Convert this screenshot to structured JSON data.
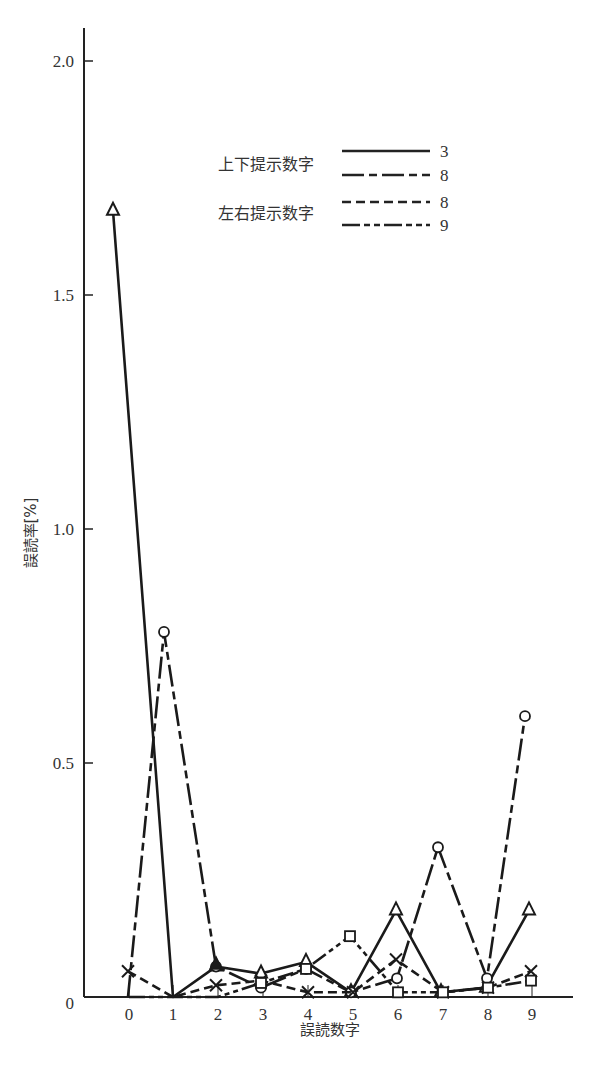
{
  "chart_data": {
    "type": "line",
    "title": "",
    "xlabel": "誤読数字",
    "ylabel": "誤読率[%]",
    "ylim": [
      0,
      2.0
    ],
    "yticks": [
      "0",
      "0.5",
      "1.0",
      "1.5",
      "2.0"
    ],
    "ytick_values": [
      0,
      0.5,
      1.0,
      1.5,
      2.0
    ],
    "categories": [
      "0",
      "1",
      "2",
      "3",
      "4",
      "5",
      "6",
      "7",
      "8",
      "9"
    ],
    "grid": false,
    "legend_position": "upper center",
    "legend_groups": [
      {
        "label": "上下提示数字",
        "entries": [
          "3",
          "8"
        ]
      },
      {
        "label": "左右提示数字",
        "entries": [
          "8",
          "9"
        ]
      }
    ],
    "series": [
      {
        "name": "上下提示数字 3",
        "group": "上下提示数字",
        "digit": "3",
        "line": "solid",
        "marker": "triangle",
        "values": [
          1.68,
          0.0,
          0.065,
          0.05,
          0.075,
          0.01,
          0.185,
          0.01,
          0.02,
          0.185
        ]
      },
      {
        "name": "上下提示数字 8",
        "group": "上下提示数字",
        "digit": "8",
        "line": "long-dash",
        "marker": "circle",
        "values": [
          0.0,
          0.78,
          0.065,
          0.02,
          0.06,
          0.01,
          0.04,
          0.32,
          0.04,
          0.6
        ]
      },
      {
        "name": "左右提示数字 8",
        "group": "左右提示数字",
        "digit": "8",
        "line": "short-dash",
        "marker": "cross",
        "values": [
          0.055,
          0.0,
          0.025,
          0.035,
          0.01,
          0.01,
          0.08,
          0.01,
          0.02,
          0.055
        ]
      },
      {
        "name": "左右提示数字 9",
        "group": "左右提示数字",
        "digit": "9",
        "line": "dash-dot",
        "marker": "square",
        "values": [
          0.0,
          0.0,
          0.0,
          0.03,
          0.06,
          0.13,
          0.01,
          0.01,
          0.02,
          0.035
        ]
      }
    ]
  },
  "legend": {
    "group1_label": "上下提示数字",
    "group2_label": "左右提示数字",
    "entry1": "3",
    "entry2": "8",
    "entry3": "8",
    "entry4": "9"
  },
  "axes": {
    "xlabel": "誤読数字",
    "ylabel": "誤読率[%]"
  }
}
